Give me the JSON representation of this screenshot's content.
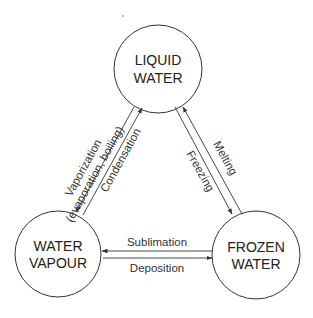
{
  "diagram": {
    "colors": {
      "stroke": "#333333",
      "text": "#222222",
      "background": "#ffffff"
    },
    "nodes": [
      {
        "id": "liquid",
        "line1": "LIQUID",
        "line2": "WATER",
        "cx": 158,
        "cy": 69,
        "r": 44
      },
      {
        "id": "vapour",
        "line1": "WATER",
        "line2": "VAPOUR",
        "cx": 58,
        "cy": 254,
        "r": 44
      },
      {
        "id": "frozen",
        "line1": "FROZEN",
        "line2": "WATER",
        "cx": 255,
        "cy": 255,
        "r": 44
      }
    ],
    "edges": [
      {
        "id": "vaporization",
        "from": "liquid",
        "to": "vapour",
        "label_line1": "Vaporization",
        "label_line2": "(evaporation, boiling)"
      },
      {
        "id": "condensation",
        "from": "vapour",
        "to": "liquid",
        "label": "Condensation"
      },
      {
        "id": "freezing",
        "from": "liquid",
        "to": "frozen",
        "label": "Freezing"
      },
      {
        "id": "melting",
        "from": "frozen",
        "to": "liquid",
        "label": "Melting"
      },
      {
        "id": "sublimation",
        "from": "frozen",
        "to": "vapour",
        "label": "Sublimation"
      },
      {
        "id": "deposition",
        "from": "vapour",
        "to": "frozen",
        "label": "Deposition"
      }
    ]
  }
}
